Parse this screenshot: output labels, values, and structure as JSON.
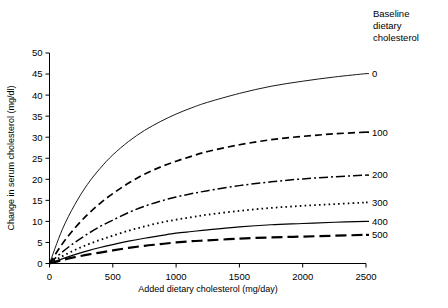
{
  "chart_data": {
    "type": "line",
    "title": "",
    "xlabel": "Added dietary cholesterol (mg/day)",
    "ylabel": "Change in serum cholesterol (mg/dl)",
    "xlim": [
      0,
      2500
    ],
    "ylim": [
      0,
      50
    ],
    "xticks": [
      0,
      500,
      1000,
      1500,
      2000,
      2500
    ],
    "xtick_labels": [
      "0",
      "500",
      "1000",
      "1500",
      "2000",
      "2500"
    ],
    "yticks": [
      0,
      5,
      10,
      15,
      20,
      25,
      30,
      35,
      40,
      45,
      50
    ],
    "ytick_labels": [
      "0",
      "5",
      "10",
      "15",
      "20",
      "25",
      "30",
      "35",
      "40",
      "45",
      "50"
    ],
    "grid": false,
    "legend_position": "right",
    "legend_title": "Baseline dietary cholesterol",
    "legend_title_lines": [
      "Baseline",
      "dietary",
      "cholesterol"
    ],
    "x": [
      0,
      100,
      200,
      300,
      400,
      500,
      625,
      750,
      875,
      1000,
      1125,
      1250,
      1500,
      1750,
      2000,
      2250,
      2500
    ],
    "series": [
      {
        "name": "0",
        "label": "0",
        "style": "solid-thin",
        "values": [
          0,
          8.0,
          14.0,
          18.8,
          22.6,
          25.8,
          29.0,
          31.6,
          33.7,
          35.5,
          37.0,
          38.3,
          40.4,
          42.1,
          43.3,
          44.3,
          45.1
        ]
      },
      {
        "name": "100",
        "label": "100",
        "style": "dashed",
        "values": [
          0,
          4.6,
          8.4,
          11.6,
          14.3,
          16.6,
          19.1,
          21.2,
          22.9,
          24.3,
          25.5,
          26.6,
          28.2,
          29.4,
          30.2,
          30.8,
          31.2
        ]
      },
      {
        "name": "200",
        "label": "200",
        "style": "dash-dot",
        "values": [
          0,
          2.7,
          5.0,
          7.0,
          8.8,
          10.3,
          12.1,
          13.6,
          14.8,
          15.8,
          16.6,
          17.3,
          18.5,
          19.4,
          20.1,
          20.6,
          21.0
        ]
      },
      {
        "name": "300",
        "label": "300",
        "style": "dotted",
        "values": [
          0,
          1.7,
          3.2,
          4.5,
          5.6,
          6.6,
          7.8,
          8.8,
          9.7,
          10.4,
          11.0,
          11.6,
          12.5,
          13.2,
          13.7,
          14.1,
          14.5
        ]
      },
      {
        "name": "400",
        "label": "400",
        "style": "solid",
        "values": [
          0,
          1.1,
          2.1,
          3.0,
          3.8,
          4.5,
          5.3,
          6.0,
          6.6,
          7.2,
          7.6,
          8.0,
          8.7,
          9.2,
          9.5,
          9.8,
          10.0
        ]
      },
      {
        "name": "500",
        "label": "500",
        "style": "long-dash",
        "values": [
          0,
          0.8,
          1.5,
          2.1,
          2.6,
          3.1,
          3.7,
          4.2,
          4.6,
          5.0,
          5.3,
          5.5,
          5.9,
          6.2,
          6.4,
          6.6,
          6.8
        ]
      }
    ]
  },
  "colors": {
    "line": "#000000",
    "axis": "#000000",
    "background": "#ffffff"
  }
}
